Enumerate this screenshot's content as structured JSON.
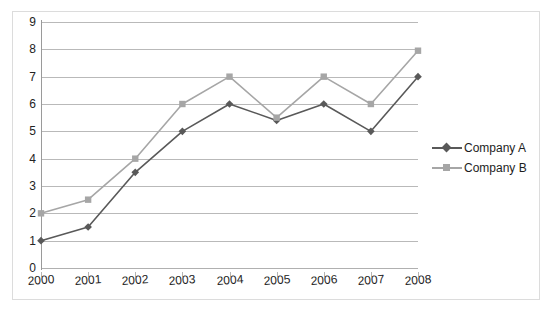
{
  "chart_data": {
    "type": "line",
    "title": "",
    "subtitle": "",
    "xlabel": "",
    "ylabel": "",
    "categories": [
      "2000",
      "2001",
      "2002",
      "2003",
      "2004",
      "2005",
      "2006",
      "2007",
      "2008"
    ],
    "series": [
      {
        "name": "Company A",
        "color": "#595959",
        "marker": "diamond",
        "values": [
          1,
          1.5,
          3.5,
          5,
          6,
          5.4,
          6,
          5,
          7
        ]
      },
      {
        "name": "Company B",
        "color": "#a6a6a6",
        "marker": "square",
        "values": [
          2,
          2.5,
          4,
          6,
          7,
          5.5,
          7,
          6,
          7.95
        ]
      }
    ],
    "ylim": [
      0,
      9
    ],
    "y_ticks": [
      0,
      1,
      2,
      3,
      4,
      5,
      6,
      7,
      8,
      9
    ],
    "y_tick_labels": [
      "0",
      "1",
      "2",
      "3",
      "4",
      "5",
      "6",
      "7",
      "8",
      "9"
    ],
    "grid": true,
    "grid_axis": "y",
    "legend_position": "right"
  },
  "legend": {
    "entries": [
      {
        "label": "Company A"
      },
      {
        "label": "Company B"
      }
    ]
  },
  "colors": {
    "series_a": "#595959",
    "series_b": "#a6a6a6",
    "gridline": "#b9b9b9",
    "axis": "#9a9a9a",
    "frame": "#dcdcdc",
    "text": "#232323"
  }
}
